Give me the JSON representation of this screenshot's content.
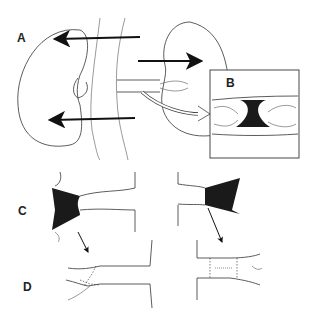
{
  "figure": {
    "panels": [
      {
        "id": "A",
        "label": "A",
        "description": "Kidneys with ureters; arrows indicate directions"
      },
      {
        "id": "B",
        "label": "B",
        "description": "Inset magnified view of ureteral stricture"
      },
      {
        "id": "C",
        "label": "C",
        "description": "Stricture excision of left and right ureters"
      },
      {
        "id": "D",
        "label": "D",
        "description": "End-to-end anastomosis with sutures"
      }
    ],
    "colors": {
      "ink": "#222222",
      "background": "#ffffff"
    }
  }
}
